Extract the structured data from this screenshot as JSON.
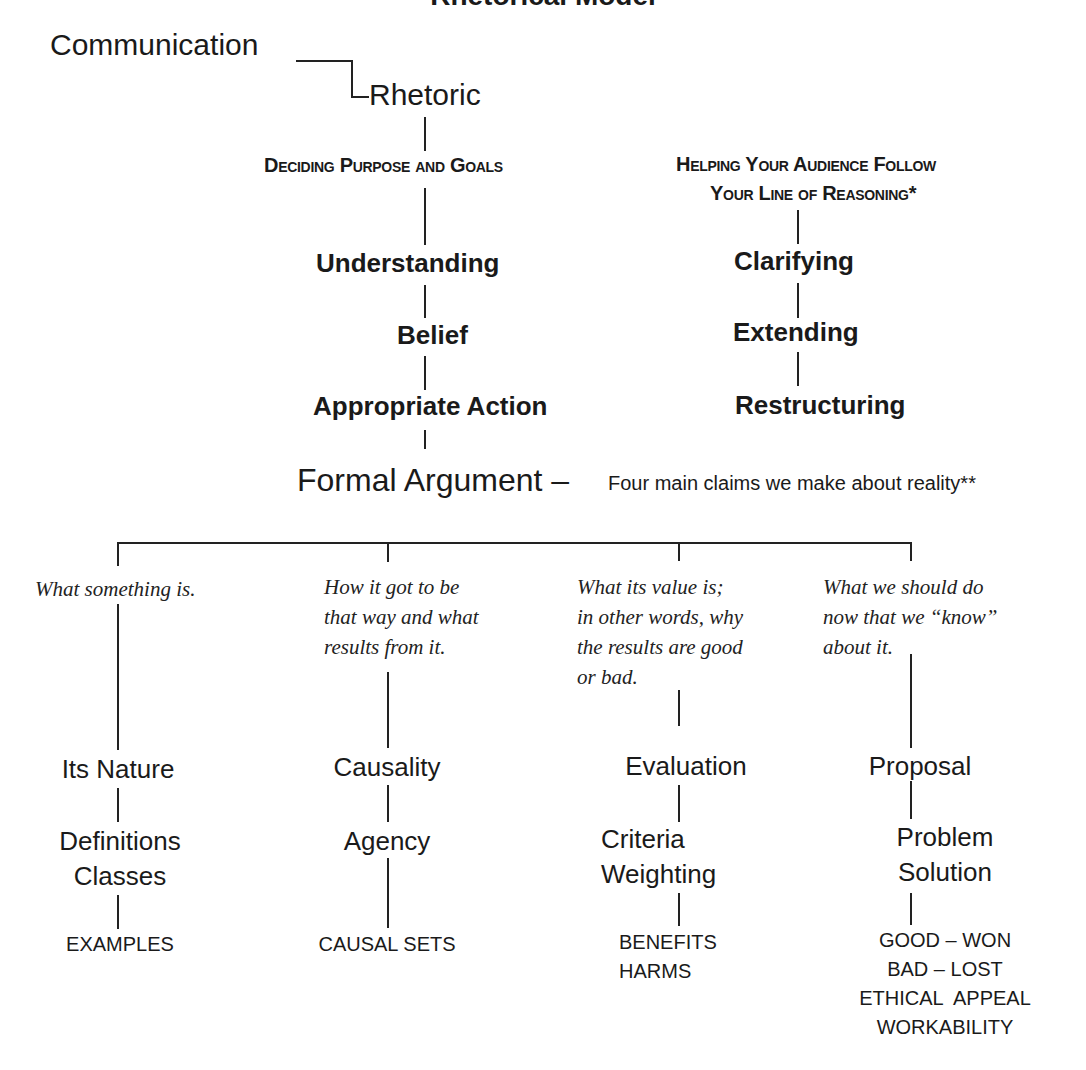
{
  "title": "Rhetorical Model",
  "root": {
    "communication": "Communication",
    "rhetoric": "Rhetoric"
  },
  "branches": {
    "purpose": {
      "heading": "Deciding Purpose and Goals",
      "items": [
        "Understanding",
        "Belief",
        "Appropriate Action"
      ]
    },
    "reasoning": {
      "heading_line1": "Helping Your Audience Follow",
      "heading_line2": "Your Line of Reasoning*",
      "items": [
        "Clarifying",
        "Extending",
        "Restructuring"
      ]
    }
  },
  "formal_argument": {
    "label": "Formal Argument –",
    "description": "Four main claims we make about reality**"
  },
  "claims": [
    {
      "question": [
        "What something is."
      ],
      "category": "Its Nature",
      "subcategories": [
        "Definitions",
        "Classes"
      ],
      "details": [
        "EXAMPLES"
      ]
    },
    {
      "question": [
        "How it got to be",
        "that way and what",
        "results from it."
      ],
      "category": "Causality",
      "subcategories": [
        "Agency"
      ],
      "details": [
        "CAUSAL SETS"
      ]
    },
    {
      "question": [
        "What its value is;",
        "in other words, why",
        "the results are good",
        "or bad."
      ],
      "category": "Evaluation",
      "subcategories": [
        "Criteria",
        "Weighting"
      ],
      "details": [
        "BENEFITS",
        "HARMS"
      ]
    },
    {
      "question": [
        "What we should do",
        "now that we “know”",
        "about it."
      ],
      "category": "Proposal",
      "subcategories": [
        "Problem",
        "Solution"
      ],
      "details": [
        "GOOD – WON",
        "BAD – LOST",
        "ETHICAL  APPEAL",
        "WORKABILITY"
      ]
    }
  ]
}
